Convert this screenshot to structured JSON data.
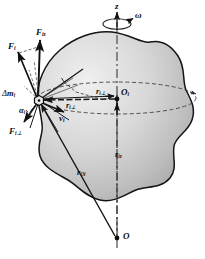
{
  "figure": {
    "caption": ""
  },
  "axis": {
    "z_label": "z",
    "omega_label": "ω",
    "origin_label": "O",
    "center_label": "O",
    "center_sub": "i"
  },
  "particle": {
    "mass_prefix": "Δ",
    "mass_label": "m",
    "mass_sub": "i",
    "angle_label": "α",
    "angle_sub": "i"
  },
  "vectors": [
    {
      "name": "force-total",
      "label": "F",
      "sub": "i",
      "x": 8,
      "y": 42
    },
    {
      "name": "force-axial",
      "label": "F",
      "sub": "iz",
      "x": 36,
      "y": 28
    },
    {
      "name": "force-perp",
      "label": "F",
      "sub": "i⊥",
      "x": 10,
      "y": 127
    },
    {
      "name": "velocity",
      "label": "v",
      "sub": "i",
      "x": 59,
      "y": 114
    },
    {
      "name": "radius-perp-upper",
      "label": "r",
      "sub": "i⊥",
      "x": 97,
      "y": 90
    },
    {
      "name": "radius-perp-lower",
      "label": "r",
      "sub": "i⊥",
      "x": 66,
      "y": 104
    },
    {
      "name": "radius-axial",
      "label": "r",
      "sub": "iz",
      "x": 116,
      "y": 152
    },
    {
      "name": "radius-origin",
      "label": "r",
      "sub": "Oi",
      "x": 78,
      "y": 170
    }
  ],
  "colors": {
    "body_light": "#e6e6e6",
    "body_mid": "#c9c9c9",
    "body_dark": "#a8a8a8",
    "stroke": "#1a1a1a",
    "dashed": "#3a3a3a",
    "background": "#ffffff"
  }
}
